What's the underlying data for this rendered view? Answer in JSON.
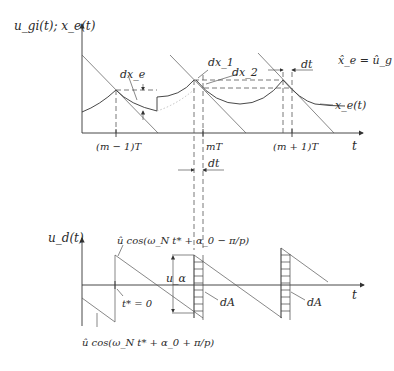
{
  "top_plot": {
    "y_label": "u_gi(t); x_e(t)",
    "x_label": "t",
    "ticks": [
      "(m − 1)T",
      "mT",
      "(m + 1)T"
    ],
    "annotations": {
      "dx_e": "dx_e",
      "dx_1": "dx_1",
      "dx_2": "dx_2",
      "dt": "dt",
      "x_e_curve": "x_e(t)",
      "equality": "x̂_e = û_g"
    }
  },
  "middle": {
    "dt": "dt"
  },
  "bottom_plot": {
    "y_label": "u_d(t)",
    "x_label": "t",
    "annotations": {
      "upper_expr": "û cos(ω_N t* + α_0 − π/p)",
      "lower_expr": "û cos(ω_N t* + α_0 + π/p)",
      "t_star": "t* = 0",
      "u_alpha": "u_α",
      "dA_1": "dA",
      "dA_2": "dA"
    }
  }
}
